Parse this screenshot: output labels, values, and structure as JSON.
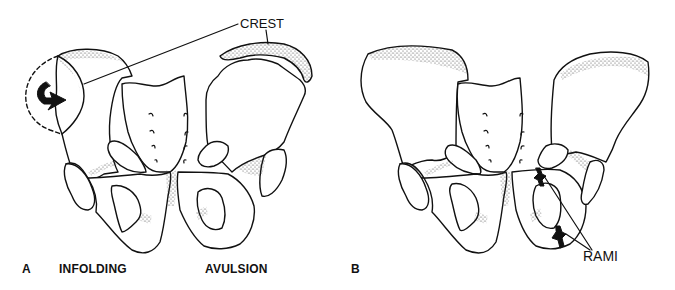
{
  "figure": {
    "panels": [
      {
        "id": "A",
        "panel_label": "A",
        "captions": [
          "INFOLDING",
          "AVULSION"
        ],
        "callout": "CREST"
      },
      {
        "id": "B",
        "panel_label": "B",
        "callout": "RAMI"
      }
    ],
    "colors": {
      "line": "#111111",
      "background": "#ffffff",
      "stipple": "#333333"
    }
  }
}
